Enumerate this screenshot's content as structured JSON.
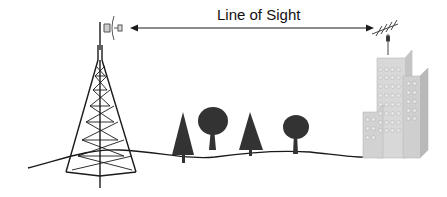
{
  "diagram": {
    "title": "Line of Sight",
    "elements": [
      {
        "type": "transmission-tower",
        "detail": "lattice tower with dish antenna"
      },
      {
        "type": "arrow",
        "direction": "bidirectional",
        "label": "Line of Sight"
      },
      {
        "type": "yagi-antenna",
        "detail": "on top of building"
      },
      {
        "type": "building",
        "detail": "multi-storey office buildings"
      },
      {
        "type": "trees",
        "count": 4,
        "kinds": [
          "conifer",
          "deciduous",
          "conifer",
          "deciduous"
        ]
      },
      {
        "type": "ground-line"
      }
    ],
    "colors": {
      "ink": "#1a1a1a",
      "building_light": "#d8d8d8",
      "building_dark": "#bdbdbd",
      "tree": "#333333"
    }
  }
}
